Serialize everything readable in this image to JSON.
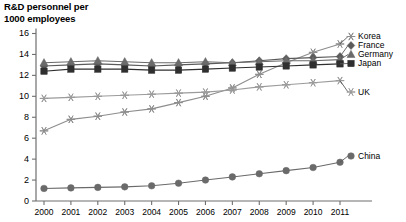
{
  "chart_data": {
    "type": "line",
    "title": "R&D personnel per\n1000 employees",
    "xlabel": "",
    "ylabel": "",
    "grid": false,
    "legend_position": "right-inline",
    "ylim": [
      0,
      16
    ],
    "yticks": [
      0,
      2,
      4,
      6,
      8,
      10,
      12,
      14,
      16
    ],
    "ytick_labels": [
      "0",
      "2",
      "4",
      "6",
      "8",
      "10",
      "12",
      "14",
      "16"
    ],
    "x": [
      2000,
      2001,
      2002,
      2003,
      2004,
      2005,
      2006,
      2007,
      2008,
      2009,
      2010,
      2011
    ],
    "categories": [
      "2000",
      "2001",
      "2002",
      "2003",
      "2004",
      "2005",
      "2006",
      "2007",
      "2008",
      "2009",
      "2010",
      "2011"
    ],
    "series": [
      {
        "name": "Korea",
        "marker": "asterisk",
        "color": "#8d8d8d",
        "values": [
          6.7,
          7.8,
          8.1,
          8.5,
          8.8,
          9.4,
          10.0,
          10.8,
          12.1,
          13.2,
          14.2,
          15.0
        ]
      },
      {
        "name": "France",
        "marker": "diamond",
        "color": "#5a5a5a",
        "values": [
          12.9,
          13.0,
          13.1,
          13.0,
          12.9,
          13.0,
          13.1,
          13.2,
          13.4,
          13.6,
          13.7,
          13.8
        ]
      },
      {
        "name": "Germany",
        "marker": "triangle",
        "color": "#6b6b6b",
        "values": [
          13.2,
          13.3,
          13.4,
          13.3,
          13.2,
          13.2,
          13.3,
          13.2,
          13.3,
          13.4,
          13.4,
          13.5
        ]
      },
      {
        "name": "Japan",
        "marker": "square",
        "color": "#2f2f2f",
        "values": [
          12.4,
          12.6,
          12.6,
          12.6,
          12.5,
          12.5,
          12.6,
          12.7,
          12.8,
          12.9,
          13.0,
          13.1
        ]
      },
      {
        "name": "UK",
        "marker": "asterisk",
        "color": "#9b9b9b",
        "values": [
          9.8,
          9.9,
          10.0,
          10.1,
          10.2,
          10.3,
          10.4,
          10.6,
          10.9,
          11.1,
          11.3,
          11.5
        ]
      },
      {
        "name": "China",
        "marker": "circle",
        "color": "#6a6a6a",
        "values": [
          1.2,
          1.25,
          1.3,
          1.35,
          1.45,
          1.7,
          2.0,
          2.3,
          2.6,
          2.9,
          3.2,
          3.7
        ]
      }
    ]
  },
  "legend": {
    "items": [
      {
        "label": "Korea"
      },
      {
        "label": "France"
      },
      {
        "label": "Germany"
      },
      {
        "label": "Japan"
      },
      {
        "label": "UK"
      },
      {
        "label": "China"
      }
    ]
  },
  "colors": {
    "axis": "#6f6f6f",
    "text": "#000000",
    "background": "#ffffff"
  }
}
